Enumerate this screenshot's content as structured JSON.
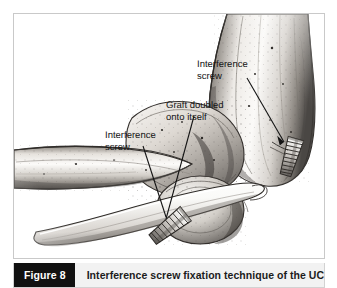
{
  "figure": {
    "tag_label": "Figure 8",
    "caption": "Interference screw fixation technique of the UCL",
    "frame_border_color": "#c9c9c9",
    "caption_bar_color": "#f2f2f2",
    "tag_background_color": "#111111",
    "tag_text_color": "#ffffff"
  },
  "illustration": {
    "subject": "elbow-ucl-interference-screw-fixation",
    "style": "grayscale-medical-pen-and-ink",
    "labels": [
      {
        "id": "interference-screw-humeral",
        "text": "Interference\nscrew",
        "points_to": "humeral-interference-screw"
      },
      {
        "id": "graft-doubled",
        "text": "Graft doubled\nonto itself",
        "points_to": "doubled-tendon-graft"
      },
      {
        "id": "interference-screw-ulnar",
        "text": "Interference\nscrew",
        "points_to": "ulnar-interference-screw"
      }
    ],
    "anatomy": [
      {
        "id": "humerus",
        "name": "humerus"
      },
      {
        "id": "ulna",
        "name": "ulna"
      },
      {
        "id": "radius",
        "name": "radius"
      },
      {
        "id": "medial-epicondyle",
        "name": "medial epicondyle"
      },
      {
        "id": "olecranon",
        "name": "olecranon"
      },
      {
        "id": "graft",
        "name": "doubled tendon graft"
      },
      {
        "id": "screw-humeral",
        "name": "humeral interference screw"
      },
      {
        "id": "screw-ulnar",
        "name": "ulnar interference screw"
      }
    ],
    "colors": {
      "bone_light": "#f4f2ef",
      "bone_mid": "#c8c4bf",
      "bone_shadow": "#6e6a66",
      "bone_dark": "#3a3734",
      "graft_highlight": "#fbfaf8",
      "leader_line": "#1a1a1a"
    }
  }
}
